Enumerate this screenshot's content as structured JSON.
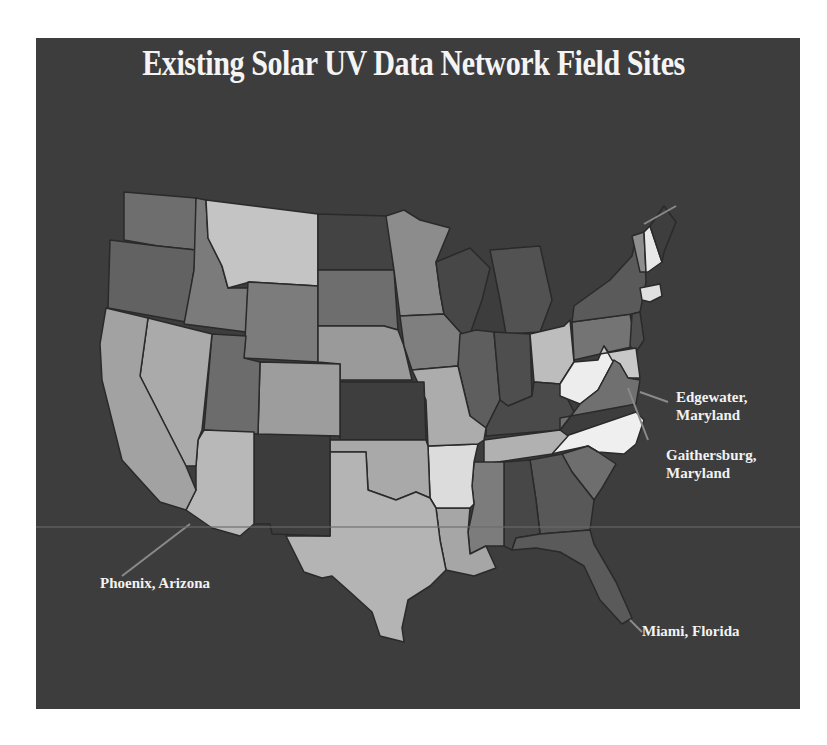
{
  "title": "Existing Solar UV Data Network Field Sites",
  "colors": {
    "background": "#ffffff",
    "panel": "#3d3d3d",
    "title_text": "#f4f4f4",
    "label_text": "#f2f2f2",
    "state_border": "#2a2a2a"
  },
  "sites": [
    {
      "id": "edgewater",
      "line1": "Edgewater,",
      "line2": "Maryland"
    },
    {
      "id": "gaithersburg",
      "line1": "Gaithersburg,",
      "line2": "Maryland"
    },
    {
      "id": "phoenix",
      "line1": "Phoenix, Arizona",
      "line2": ""
    },
    {
      "id": "miami",
      "line1": "Miami, Florida",
      "line2": ""
    }
  ],
  "map": {
    "region": "Contiguous United States",
    "shading": "grayscale choropleth (no legend shown)"
  }
}
